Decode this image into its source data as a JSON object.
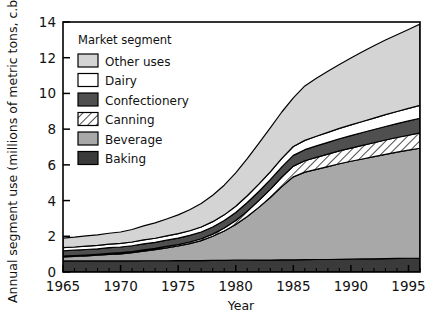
{
  "chart_data": {
    "type": "area",
    "stacked": true,
    "title": "",
    "xlabel": "Year",
    "ylabel": "Annual segment use (millions of metric tons, c.b.)",
    "xlim": [
      1965,
      1996
    ],
    "ylim": [
      0,
      14
    ],
    "xticks": [
      1965,
      1970,
      1975,
      1980,
      1985,
      1990,
      1995
    ],
    "xtick_labels": [
      "1965",
      "1970",
      "1975",
      "1980",
      "1985",
      "1990",
      "1995"
    ],
    "yticks": [
      0,
      2,
      4,
      6,
      8,
      10,
      12,
      14
    ],
    "ytick_labels": [
      "0",
      "2",
      "4",
      "6",
      "8",
      "10",
      "12",
      "14"
    ],
    "minor_xtick_interval": 1,
    "grid": false,
    "legend_position": "upper-left-inside",
    "legend_title": "Market segment",
    "x": [
      1965,
      1966,
      1967,
      1968,
      1969,
      1970,
      1971,
      1972,
      1973,
      1974,
      1975,
      1976,
      1977,
      1978,
      1979,
      1980,
      1981,
      1982,
      1983,
      1984,
      1985,
      1986,
      1987,
      1988,
      1989,
      1990,
      1991,
      1992,
      1993,
      1994,
      1995,
      1996
    ],
    "stack_order_bottom_to_top": [
      "Baking",
      "Beverage",
      "Canning",
      "Confectionery",
      "Dairy",
      "Other uses"
    ],
    "series": [
      {
        "name": "Baking",
        "color": "#3a3a3a",
        "pattern": "solid",
        "values": [
          0.62,
          0.62,
          0.62,
          0.62,
          0.62,
          0.62,
          0.62,
          0.63,
          0.63,
          0.63,
          0.64,
          0.64,
          0.64,
          0.65,
          0.65,
          0.66,
          0.66,
          0.67,
          0.67,
          0.68,
          0.68,
          0.69,
          0.7,
          0.7,
          0.71,
          0.72,
          0.73,
          0.74,
          0.75,
          0.76,
          0.77,
          0.78
        ]
      },
      {
        "name": "Beverage",
        "color": "#a8a8a8",
        "pattern": "solid",
        "values": [
          0.22,
          0.25,
          0.28,
          0.32,
          0.36,
          0.4,
          0.46,
          0.54,
          0.62,
          0.72,
          0.82,
          0.95,
          1.12,
          1.35,
          1.65,
          2.0,
          2.45,
          2.95,
          3.5,
          4.1,
          4.65,
          4.9,
          5.05,
          5.2,
          5.35,
          5.48,
          5.6,
          5.72,
          5.84,
          5.95,
          6.05,
          6.15
        ]
      },
      {
        "name": "Canning",
        "color": "#ffffff",
        "pattern": "hatch",
        "values": [
          0.05,
          0.05,
          0.05,
          0.05,
          0.06,
          0.06,
          0.06,
          0.07,
          0.07,
          0.08,
          0.08,
          0.09,
          0.1,
          0.12,
          0.16,
          0.22,
          0.3,
          0.38,
          0.46,
          0.54,
          0.6,
          0.64,
          0.67,
          0.7,
          0.72,
          0.74,
          0.76,
          0.78,
          0.8,
          0.82,
          0.84,
          0.86
        ]
      },
      {
        "name": "Confectionery",
        "color": "#4f4f4f",
        "pattern": "solid",
        "values": [
          0.3,
          0.3,
          0.31,
          0.31,
          0.32,
          0.32,
          0.33,
          0.34,
          0.34,
          0.35,
          0.36,
          0.37,
          0.38,
          0.4,
          0.42,
          0.45,
          0.48,
          0.51,
          0.54,
          0.57,
          0.6,
          0.62,
          0.64,
          0.66,
          0.68,
          0.7,
          0.72,
          0.74,
          0.76,
          0.78,
          0.8,
          0.82
        ]
      },
      {
        "name": "Dairy",
        "color": "#ffffff",
        "pattern": "solid",
        "values": [
          0.18,
          0.18,
          0.19,
          0.19,
          0.2,
          0.2,
          0.21,
          0.22,
          0.23,
          0.24,
          0.25,
          0.26,
          0.28,
          0.3,
          0.32,
          0.35,
          0.38,
          0.41,
          0.44,
          0.47,
          0.5,
          0.52,
          0.54,
          0.56,
          0.58,
          0.6,
          0.62,
          0.64,
          0.66,
          0.68,
          0.7,
          0.72
        ]
      },
      {
        "name": "Other uses",
        "color": "#d4d4d4",
        "pattern": "solid",
        "values": [
          0.53,
          0.55,
          0.57,
          0.59,
          0.61,
          0.64,
          0.7,
          0.78,
          0.86,
          0.95,
          1.05,
          1.18,
          1.32,
          1.48,
          1.66,
          1.87,
          2.08,
          2.28,
          2.46,
          2.6,
          2.72,
          3.05,
          3.25,
          3.42,
          3.58,
          3.74,
          3.9,
          4.05,
          4.18,
          4.3,
          4.42,
          4.55
        ]
      }
    ],
    "totals": [
      1.9,
      1.95,
      2.02,
      2.08,
      2.17,
      2.24,
      2.38,
      2.58,
      2.75,
      2.97,
      3.2,
      3.49,
      3.84,
      4.3,
      4.86,
      5.55,
      6.35,
      7.2,
      8.07,
      8.96,
      9.75,
      10.42,
      10.85,
      11.24,
      11.62,
      11.98,
      12.33,
      12.67,
      12.99,
      13.29,
      13.58,
      13.88
    ]
  },
  "legend": {
    "title": "Market segment",
    "entries": [
      {
        "label": "Other uses",
        "color": "#d4d4d4",
        "pattern": "solid"
      },
      {
        "label": "Dairy",
        "color": "#ffffff",
        "pattern": "solid"
      },
      {
        "label": "Confectionery",
        "color": "#4f4f4f",
        "pattern": "solid"
      },
      {
        "label": "Canning",
        "color": "#ffffff",
        "pattern": "hatch"
      },
      {
        "label": "Beverage",
        "color": "#a8a8a8",
        "pattern": "solid"
      },
      {
        "label": "Baking",
        "color": "#3a3a3a",
        "pattern": "solid"
      }
    ]
  },
  "style": {
    "frame_color": "#000000",
    "background": "#ffffff",
    "outline_color": "#000000"
  }
}
